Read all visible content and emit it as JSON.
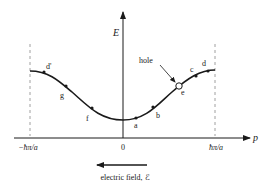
{
  "diagram": {
    "type": "band-structure",
    "axes": {
      "y_label": "E",
      "x_label": "p",
      "x_ticks": [
        "−ħπ/a",
        "0",
        "ħπ/a"
      ]
    },
    "points": [
      {
        "id": "d_prime",
        "label": "d'"
      },
      {
        "id": "g",
        "label": "g"
      },
      {
        "id": "f",
        "label": "f"
      },
      {
        "id": "a",
        "label": "a"
      },
      {
        "id": "b",
        "label": "b"
      },
      {
        "id": "e",
        "label": "e"
      },
      {
        "id": "c",
        "label": "c"
      },
      {
        "id": "d",
        "label": "d"
      }
    ],
    "hole_label": "hole",
    "field_label": "electric field, ℰ",
    "colors": {
      "ink": "#1a1a1a",
      "dash": "#888888",
      "background": "#ffffff"
    }
  }
}
